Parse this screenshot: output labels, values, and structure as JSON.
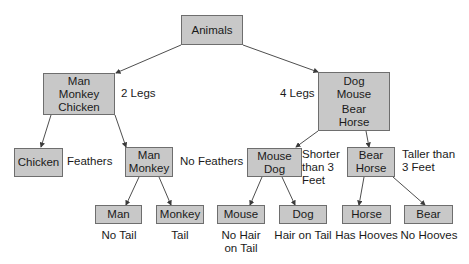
{
  "diagram": {
    "type": "decision-tree",
    "root": {
      "lines": [
        "Animals"
      ]
    },
    "level1": {
      "left": {
        "lines": [
          "Man",
          "Monkey",
          "Chicken"
        ],
        "criterion": "2 Legs"
      },
      "right": {
        "lines": [
          "Dog",
          "Mouse",
          "Bear",
          "Horse"
        ],
        "criterion": "4 Legs"
      }
    },
    "level2": {
      "chicken": {
        "lines": [
          "Chicken"
        ],
        "criterion": "Feathers"
      },
      "man_monkey": {
        "lines": [
          "Man",
          "Monkey"
        ],
        "criterion": "No Feathers"
      },
      "mouse_dog": {
        "lines": [
          "Mouse",
          "Dog"
        ],
        "criterion": [
          "Shorter",
          "than 3",
          "Feet"
        ]
      },
      "bear_horse": {
        "lines": [
          "Bear",
          "Horse"
        ],
        "criterion": [
          "Taller than",
          "3 Feet"
        ]
      }
    },
    "leaves": [
      {
        "name": "Man",
        "criterion": [
          "No Tail"
        ]
      },
      {
        "name": "Monkey",
        "criterion": [
          "Tail"
        ]
      },
      {
        "name": "Mouse",
        "criterion": [
          "No Hair",
          "on Tail"
        ]
      },
      {
        "name": "Dog",
        "criterion": [
          "Hair on Tail"
        ]
      },
      {
        "name": "Horse",
        "criterion": [
          "Has Hooves"
        ]
      },
      {
        "name": "Bear",
        "criterion": [
          "No Hooves"
        ]
      }
    ],
    "colors": {
      "node_fill": "#c8c8c8",
      "node_border": "#6e6e6e",
      "edge": "#3a3a3a",
      "background": "#ffffff"
    }
  }
}
